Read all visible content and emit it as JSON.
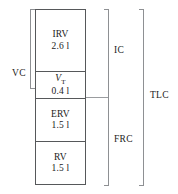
{
  "diagram": {
    "units": "l",
    "segments": [
      {
        "id": "irv",
        "label": "IRV",
        "value": "2.6 l",
        "volume_litres": 2.6,
        "name": "inspiratory reserve volume"
      },
      {
        "id": "vt",
        "label": "V",
        "label_subscript": "T",
        "value": "0.4 l",
        "volume_litres": 0.4,
        "name": "tidal volume"
      },
      {
        "id": "erv",
        "label": "ERV",
        "value": "1.5 l",
        "volume_litres": 1.5,
        "name": "expiratory reserve volume"
      },
      {
        "id": "rv",
        "label": "RV",
        "value": "1.5 l",
        "volume_litres": 1.5,
        "name": "residual volume"
      }
    ],
    "capacities": [
      {
        "id": "vc",
        "label": "VC",
        "side": "left",
        "name": "vital capacity"
      },
      {
        "id": "ic",
        "label": "IC",
        "side": "right",
        "name": "inspiratory capacity"
      },
      {
        "id": "frc",
        "label": "FRC",
        "side": "right",
        "name": "functional residual capacity"
      },
      {
        "id": "tlc",
        "label": "TLC",
        "side": "right",
        "name": "total lung capacity"
      }
    ],
    "colors": {
      "box_border": "#56585a",
      "bracket": "#8e9093",
      "text": "#1b1b1b",
      "background": "#ffffff"
    }
  }
}
